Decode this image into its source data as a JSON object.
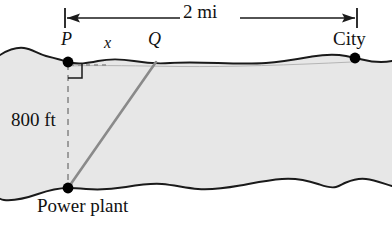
{
  "figure": {
    "title_labels": {
      "distance_top": "2 mi",
      "point_p": "P",
      "segment_x": "x",
      "point_q": "Q",
      "city": "City",
      "depth": "800 ft",
      "power_plant": "Power plant"
    },
    "colors": {
      "water_fill": "#e7e7e7",
      "shore_line": "#111111",
      "cable_line": "#8a8a8a",
      "dashed_line": "#8a8a8a",
      "marker": "#000000",
      "background": "#ffffff"
    },
    "geometry": {
      "point_p": {
        "x": 68,
        "y": 62
      },
      "point_q": {
        "x": 155,
        "y": 62
      },
      "point_city": {
        "x": 355,
        "y": 58
      },
      "point_power_plant": {
        "x": 68,
        "y": 188
      },
      "dimension_arrow_left_x": 65,
      "dimension_arrow_right_x": 357,
      "dimension_arrow_y": 18
    }
  }
}
